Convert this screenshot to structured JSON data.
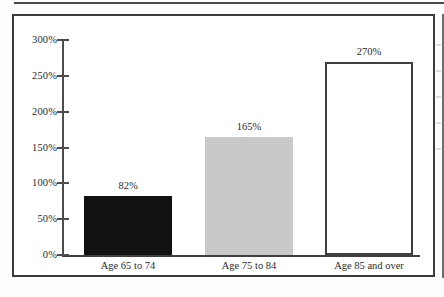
{
  "chart_data": {
    "type": "bar",
    "title": "",
    "subtitle": "",
    "xlabel": "",
    "ylabel": "",
    "categories": [
      "Age 65 to 74",
      "Age 75 to 84",
      "Age 85 and over"
    ],
    "values": [
      82,
      165,
      270
    ],
    "value_labels": [
      "82%",
      "165%",
      "270%"
    ],
    "bar_styles": [
      "solid-black",
      "solid-gray",
      "outline-white"
    ],
    "bar_colors": [
      "#111111",
      "#c9c9c9",
      "#ffffff"
    ],
    "bar_border_color": "#3f3f3f",
    "ylim": [
      0,
      300
    ],
    "ytick_values": [
      300,
      250,
      200,
      150,
      100,
      50,
      0
    ],
    "ytick_labels": [
      "300%",
      "250%",
      "200%",
      "150%",
      "100%",
      "50%",
      "0%"
    ],
    "grid": false,
    "legend": false,
    "legend_position": "none",
    "axis_color": "#4d4d4d",
    "text_color": "#2b2b2b",
    "frame_color": "#3c3c3c"
  },
  "figure": {
    "background": "#ffffff",
    "has_outer_border": true,
    "has_top_rule": true
  }
}
